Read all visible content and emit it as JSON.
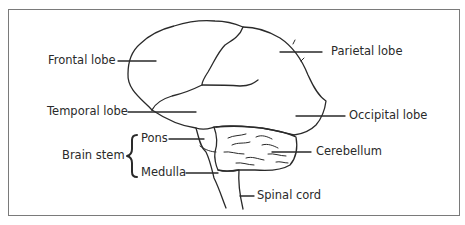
{
  "diagram": {
    "type": "labeled anatomical diagram",
    "labels": {
      "frontal_lobe": "Frontal lobe",
      "parietal_lobe": "Parietal lobe",
      "temporal_lobe": "Temporal lobe",
      "occipital_lobe": "Occipital lobe",
      "brain_stem": "Brain stem",
      "pons": "Pons",
      "medulla": "Medulla",
      "cerebellum": "Cerebellum",
      "spinal_cord": "Spinal cord"
    },
    "groups": [
      {
        "name": "Brain stem",
        "members": [
          "Pons",
          "Medulla"
        ]
      }
    ],
    "colors": {
      "line": "#2a2a2a",
      "frame": "#7a7a7a",
      "background": "#ffffff"
    }
  }
}
